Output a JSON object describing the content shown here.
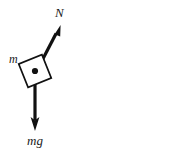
{
  "figure": {
    "kind": "free-body-diagram",
    "background_color": "#ffffff",
    "stroke_color": "#111111",
    "canvas": {
      "width": 173,
      "height": 155
    }
  },
  "body": {
    "name": "block",
    "mass_label": "m",
    "shape": "rotated-square",
    "rotation_degrees": -22,
    "center": {
      "x": 35,
      "y": 71
    },
    "side_px": 25
  },
  "pivot": {
    "label": "point-of-application",
    "x": 35,
    "y": 71
  },
  "vectors": [
    {
      "id": "normal-force",
      "label": "N",
      "description": "normal force arrow pointing up and to the right",
      "from": {
        "x": 35,
        "y": 72
      },
      "to": {
        "x": 60,
        "y": 24
      },
      "direction_degrees": 62,
      "color": "#111111"
    },
    {
      "id": "weight-force",
      "label": "mg",
      "description": "weight arrow pointing straight down",
      "from": {
        "x": 35,
        "y": 71
      },
      "to": {
        "x": 35,
        "y": 131
      },
      "direction_degrees": -90,
      "color": "#111111"
    }
  ],
  "labels": {
    "normal": "N",
    "mass": "m",
    "weight": "mg"
  }
}
